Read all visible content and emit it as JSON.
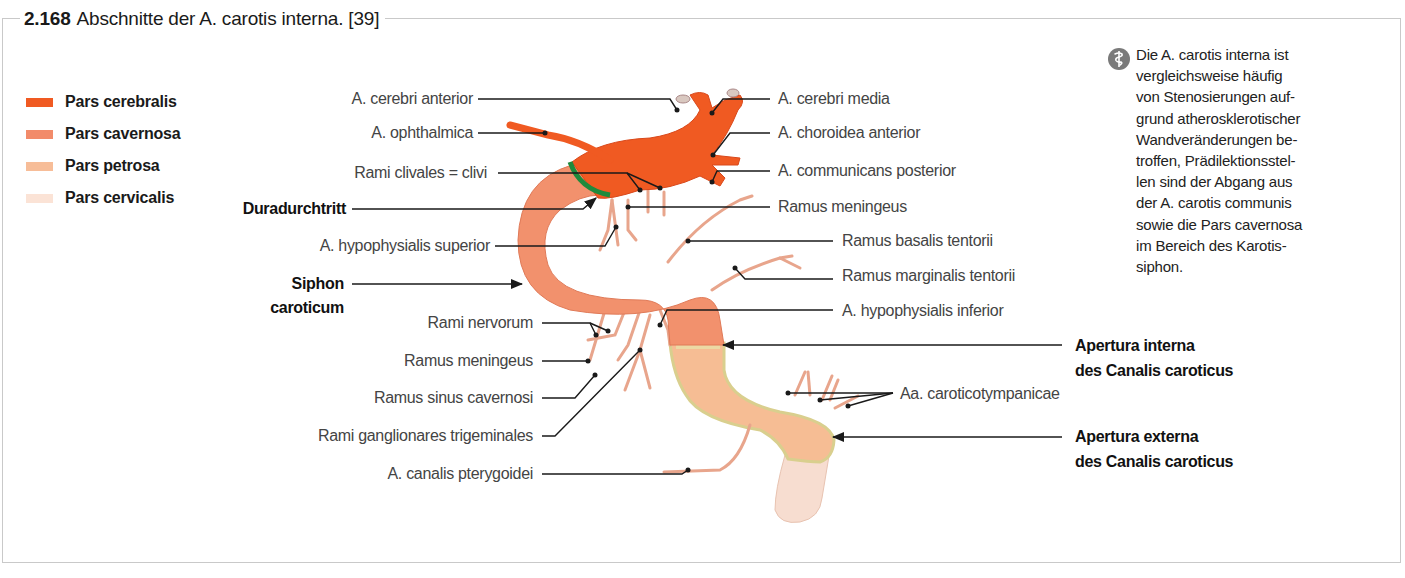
{
  "figure": {
    "number": "2.168",
    "title": "Abschnitte der A. carotis interna. [39]"
  },
  "legend": {
    "items": [
      {
        "label": "Pars cerebralis",
        "color": "#f05a22"
      },
      {
        "label": "Pars cavernosa",
        "color": "#f28b6a"
      },
      {
        "label": "Pars petrosa",
        "color": "#f7bd98"
      },
      {
        "label": "Pars cervicalis",
        "color": "#fbe3d6"
      }
    ]
  },
  "note": {
    "icon": "caduceus-icon",
    "text": "Die A. carotis interna ist\nvergleichsweise häufig\nvon Stenosierungen auf-\ngrund atherosklerotischer\nWandveränderungen be-\ntroffen, Prädilektionsstel-\nlen sind der Abgang aus\nder A. carotis communis\nsowie die Pars cavernosa\nim Bereich des Karotis-\nsiphon."
  },
  "labels_left": {
    "cerebri_anterior": "A. cerebri anterior",
    "ophthalmica": "A. ophthalmica",
    "rami_clivales": "Rami clivales = clivi",
    "duradurchtritt": "Duradurchtritt",
    "hypophysialis_superior": "A. hypophysialis superior",
    "siphon_1": "Siphon",
    "siphon_2": "caroticum",
    "rami_nervorum": "Rami nervorum",
    "ramus_meningeus_low": "Ramus meningeus",
    "ramus_sinus_cavernosi": "Ramus sinus cavernosi",
    "rami_ganglionares": "Rami ganglionares trigeminales",
    "canalis_pterygoidei": "A. canalis pterygoidei"
  },
  "labels_right": {
    "cerebri_media": "A. cerebri media",
    "choroidea_anterior": "A. choroidea anterior",
    "communicans_posterior": "A. communicans posterior",
    "ramus_meningeus_up": "Ramus meningeus",
    "basalis_tentorii": "Ramus basalis tentorii",
    "marginalis_tentorii": "Ramus marginalis tentorii",
    "hypophysialis_inferior": "A. hypophysialis inferior",
    "apertura_interna_1": "Apertura interna",
    "apertura_interna_2": "des Canalis caroticus",
    "caroticotympanicae": "Aa. caroticotympanicae",
    "apertura_externa_1": "Apertura externa",
    "apertura_externa_2": "des Canalis caroticus"
  },
  "colors": {
    "dura_marker": "#1f8a3c",
    "leader_line": "#1a1a1a",
    "frame": "#c9c9c9"
  }
}
